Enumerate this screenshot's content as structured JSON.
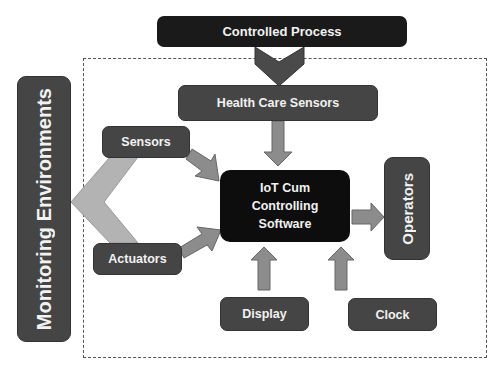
{
  "diagram": {
    "nodes": {
      "controlled_process": "Controlled Process",
      "health_care_sensors": "Health Care Sensors",
      "monitoring_environments": "Monitoring Environments",
      "sensors": "Sensors",
      "actuators": "Actuators",
      "iot_software_line1": "IoT Cum",
      "iot_software_line2": "Controlling",
      "iot_software_line3": "Software",
      "operators": "Operators",
      "display": "Display",
      "clock": "Clock"
    },
    "edges": [
      {
        "from": "Controlled Process",
        "to": "Health Care Sensors"
      },
      {
        "from": "Health Care Sensors",
        "to": "IoT Cum Controlling Software"
      },
      {
        "from": "Monitoring Environments",
        "to": "Sensors"
      },
      {
        "from": "Monitoring Environments",
        "to": "Actuators"
      },
      {
        "from": "Sensors",
        "to": "IoT Cum Controlling Software"
      },
      {
        "from": "Actuators",
        "to": "IoT Cum Controlling Software"
      },
      {
        "from": "IoT Cum Controlling Software",
        "to": "Operators"
      },
      {
        "from": "Display",
        "to": "IoT Cum Controlling Software"
      },
      {
        "from": "Clock",
        "to": "IoT Cum Controlling Software"
      }
    ],
    "colors": {
      "dark_box": "#1a1a1a",
      "mid_box": "#454545",
      "arrow_fill": "#8c8c8c",
      "chevron_fill": "#b0b0b0",
      "text": "#f2f2f2"
    }
  }
}
